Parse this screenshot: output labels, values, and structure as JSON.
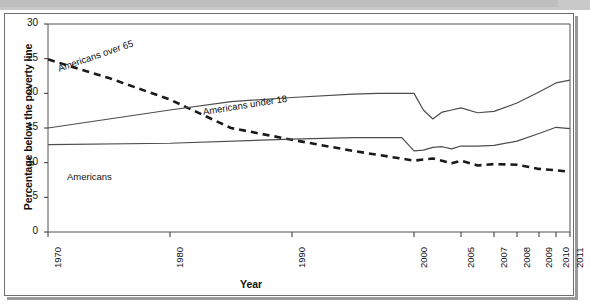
{
  "figure": {
    "ylabel": "Percentage below the poverty line",
    "xlabel": "Year"
  },
  "chart_data": {
    "type": "line",
    "title": "",
    "xlabel": "Year",
    "ylabel": "Percentage below the poverty line",
    "xlim": [
      1970,
      2011
    ],
    "ylim": [
      0,
      30
    ],
    "yticks": [
      0,
      5,
      10,
      15,
      20,
      25,
      30
    ],
    "xticks": [
      1970,
      1980,
      1990,
      2000,
      2005,
      2007,
      2008,
      2009,
      2010,
      2011
    ],
    "xtick_labels": [
      "1970",
      "1980",
      "1990",
      "2000",
      "2005",
      "2007",
      "2008",
      "2009",
      "2010",
      "2011"
    ],
    "ytick_labels": [
      "0",
      "5",
      "10",
      "15",
      "20",
      "25",
      "30"
    ],
    "grid": false,
    "legend": "inline-labels",
    "series": [
      {
        "name": "Americans over 65",
        "label": "Americans over 65",
        "style": "dashed",
        "color": "#1a1a1a",
        "label_rotation": -19,
        "x": [
          1970,
          1975,
          1980,
          1985,
          1990,
          1995,
          2000,
          2002,
          2004,
          2005,
          2006,
          2007,
          2008,
          2009,
          2010,
          2011
        ],
        "values": [
          24.9,
          22.2,
          19.1,
          15.0,
          13.3,
          11.7,
          10.3,
          10.6,
          9.9,
          10.3,
          9.6,
          9.8,
          9.7,
          9.1,
          8.9,
          8.7
        ]
      },
      {
        "name": "Americans under 18",
        "label": "Americans under 18",
        "style": "solid",
        "color": "#4d4d4d",
        "label_rotation": -9,
        "x": [
          1970,
          1975,
          1980,
          1985,
          1990,
          1995,
          1997,
          2000,
          2001,
          2002,
          2003,
          2004,
          2005,
          2006,
          2007,
          2008,
          2009,
          2010,
          2011
        ],
        "values": [
          15.0,
          16.3,
          17.6,
          18.8,
          19.4,
          19.9,
          20.0,
          20.0,
          17.6,
          16.3,
          17.3,
          17.6,
          17.9,
          17.2,
          17.4,
          18.6,
          20.2,
          21.5,
          21.9
        ]
      },
      {
        "name": "Americans",
        "label": "Americans",
        "style": "solid",
        "color": "#4d4d4d",
        "label_rotation": 0,
        "x": [
          1970,
          1980,
          1990,
          1995,
          1999,
          2000,
          2001,
          2002,
          2003,
          2004,
          2005,
          2006,
          2007,
          2008,
          2009,
          2010,
          2011
        ],
        "values": [
          12.6,
          12.8,
          13.4,
          13.6,
          13.6,
          11.7,
          11.8,
          12.2,
          12.3,
          12.0,
          12.4,
          12.4,
          12.5,
          13.1,
          14.2,
          15.1,
          14.9
        ]
      }
    ]
  }
}
